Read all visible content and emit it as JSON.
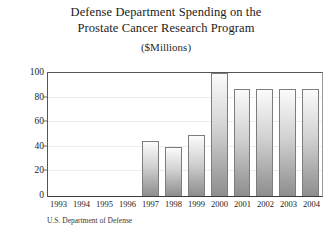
{
  "chart_data": {
    "type": "bar",
    "title": "Defense Department Spending on the Prostate Cancer Research Program",
    "title_line1": "Defense Department Spending on the",
    "title_line2": "Prostate Cancer Research Program",
    "subtitle": "($Millions)",
    "xlabel": "",
    "ylabel": "",
    "ylim": [
      0,
      100
    ],
    "yticks": [
      0,
      20,
      40,
      60,
      80,
      100
    ],
    "ytick_labels": [
      "0",
      "20",
      "40",
      "60",
      "80",
      "100"
    ],
    "grid": true,
    "legend": "none",
    "categories": [
      "1993",
      "1994",
      "1995",
      "1996",
      "1997",
      "1998",
      "1999",
      "2000",
      "2001",
      "2002",
      "2003",
      "2004"
    ],
    "values": [
      0,
      0,
      0,
      0,
      45,
      40,
      50,
      100,
      87,
      87,
      87,
      87
    ],
    "source": "U.S. Department of Defense",
    "bar_color": "#c8c8c8",
    "bar_edge_color": "#7d7d7d",
    "grid_color": "#ededed",
    "axis_color": "#3a3a3a",
    "text_color": "#1b1b1b"
  }
}
